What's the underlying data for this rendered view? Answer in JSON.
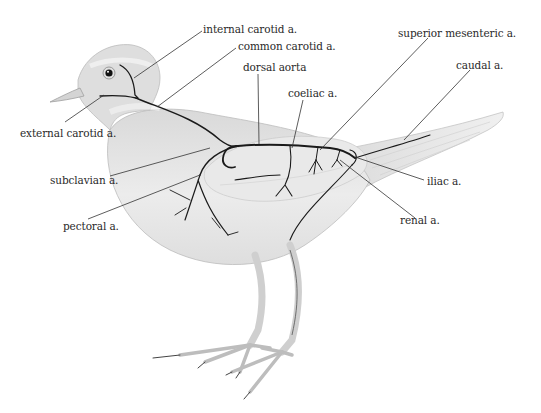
{
  "diagram": {
    "colors": {
      "background": "#ffffff",
      "body_fill": "#e6e6e6",
      "body_shade": "#cfcfcf",
      "artery": "#1a1a1a",
      "leader": "#333333",
      "label_text": "#2a2a2a"
    },
    "labels": {
      "internal_carotid": "internal carotid a.",
      "common_carotid": "common carotid a.",
      "dorsal_aorta": "dorsal aorta",
      "coeliac": "coeliac a.",
      "superior_mesenteric": "superior mesenteric a.",
      "caudal": "caudal a.",
      "external_carotid": "external carotid a.",
      "subclavian": "subclavian a.",
      "iliac": "iliac a.",
      "pectoral": "pectoral a.",
      "renal": "renal a."
    }
  }
}
